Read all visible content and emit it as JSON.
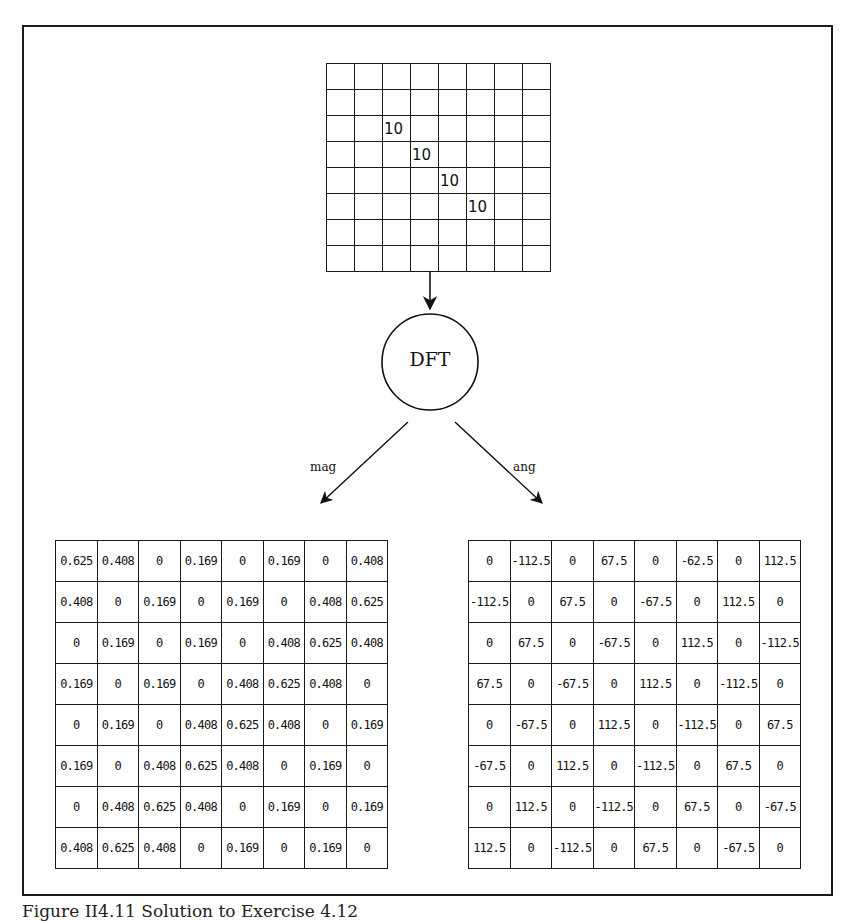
{
  "figure": {
    "caption": "Figure II4.11 Solution to Exercise 4.12",
    "operation_label": "DFT",
    "branches": {
      "magnitude_label": "mag",
      "angle_label": "ang"
    }
  },
  "input_grid": {
    "rows": 8,
    "cols": 8,
    "cells": [
      [
        "",
        "",
        "",
        "",
        "",
        "",
        "",
        ""
      ],
      [
        "",
        "",
        "",
        "",
        "",
        "",
        "",
        ""
      ],
      [
        "",
        "",
        "10",
        "",
        "",
        "",
        "",
        ""
      ],
      [
        "",
        "",
        "",
        "10",
        "",
        "",
        "",
        ""
      ],
      [
        "",
        "",
        "",
        "",
        "10",
        "",
        "",
        ""
      ],
      [
        "",
        "",
        "",
        "",
        "",
        "10",
        "",
        ""
      ],
      [
        "",
        "",
        "",
        "",
        "",
        "",
        "",
        ""
      ],
      [
        "",
        "",
        "",
        "",
        "",
        "",
        "",
        ""
      ]
    ]
  },
  "magnitude_grid": {
    "cells": [
      [
        "0.625",
        "0.408",
        "0",
        "0.169",
        "0",
        "0.169",
        "0",
        "0.408"
      ],
      [
        "0.408",
        "0",
        "0.169",
        "0",
        "0.169",
        "0",
        "0.408",
        "0.625"
      ],
      [
        "0",
        "0.169",
        "0",
        "0.169",
        "0",
        "0.408",
        "0.625",
        "0.408"
      ],
      [
        "0.169",
        "0",
        "0.169",
        "0",
        "0.408",
        "0.625",
        "0.408",
        "0"
      ],
      [
        "0",
        "0.169",
        "0",
        "0.408",
        "0.625",
        "0.408",
        "0",
        "0.169"
      ],
      [
        "0.169",
        "0",
        "0.408",
        "0.625",
        "0.408",
        "0",
        "0.169",
        "0"
      ],
      [
        "0",
        "0.408",
        "0.625",
        "0.408",
        "0",
        "0.169",
        "0",
        "0.169"
      ],
      [
        "0.408",
        "0.625",
        "0.408",
        "0",
        "0.169",
        "0",
        "0.169",
        "0"
      ]
    ]
  },
  "angle_grid": {
    "cells": [
      [
        "0",
        "-112.5",
        "0",
        "67.5",
        "0",
        "-62.5",
        "0",
        "112.5"
      ],
      [
        "-112.5",
        "0",
        "67.5",
        "0",
        "-67.5",
        "0",
        "112.5",
        "0"
      ],
      [
        "0",
        "67.5",
        "0",
        "-67.5",
        "0",
        "112.5",
        "0",
        "-112.5"
      ],
      [
        "67.5",
        "0",
        "-67.5",
        "0",
        "112.5",
        "0",
        "-112.5",
        "0"
      ],
      [
        "0",
        "-67.5",
        "0",
        "112.5",
        "0",
        "-112.5",
        "0",
        "67.5"
      ],
      [
        "-67.5",
        "0",
        "112.5",
        "0",
        "-112.5",
        "0",
        "67.5",
        "0"
      ],
      [
        "0",
        "112.5",
        "0",
        "-112.5",
        "0",
        "67.5",
        "0",
        "-67.5"
      ],
      [
        "112.5",
        "0",
        "-112.5",
        "0",
        "67.5",
        "0",
        "-67.5",
        "0"
      ]
    ]
  }
}
